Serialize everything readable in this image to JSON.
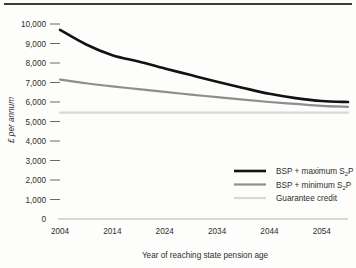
{
  "chart_data": {
    "type": "line",
    "title": "",
    "xlabel": "Year of reaching state pension age",
    "ylabel": "£ per annum",
    "x": [
      2004,
      2009,
      2014,
      2019,
      2024,
      2029,
      2034,
      2039,
      2044,
      2049,
      2054,
      2059
    ],
    "xlim": [
      2004,
      2059
    ],
    "ylim": [
      0,
      10000
    ],
    "xticks": [
      "2004",
      "2014",
      "2024",
      "2034",
      "2044",
      "2054"
    ],
    "xtick_values": [
      2004,
      2014,
      2024,
      2034,
      2044,
      2054
    ],
    "yticks": [
      "0",
      "1,000",
      "2,000",
      "3,000",
      "4,000",
      "5,000",
      "6,000",
      "7,000",
      "8,000",
      "9,000",
      "10,000"
    ],
    "ytick_values": [
      0,
      1000,
      2000,
      3000,
      4000,
      5000,
      6000,
      7000,
      8000,
      9000,
      10000
    ],
    "grid": false,
    "legend_position": "center-right",
    "series": [
      {
        "name": "BSP + maximum S2P",
        "name_base": "BSP + maximum S",
        "name_sub": "2",
        "name_tail": "P",
        "color": "#121212",
        "width": 2.6,
        "values": [
          9700,
          8950,
          8400,
          8080,
          7720,
          7380,
          7040,
          6720,
          6420,
          6200,
          6050,
          6000
        ]
      },
      {
        "name": "BSP + minimum S2P",
        "name_base": "BSP + minimum S",
        "name_sub": "2",
        "name_tail": "P",
        "color": "#8e8e8e",
        "width": 2.2,
        "values": [
          7150,
          6960,
          6800,
          6660,
          6520,
          6380,
          6250,
          6120,
          6000,
          5900,
          5800,
          5750
        ]
      },
      {
        "name": "Guarantee credit",
        "name_base": "Guarantee credit",
        "name_sub": "",
        "name_tail": "",
        "color": "#d8d8d8",
        "width": 2.2,
        "values": [
          5450,
          5450,
          5450,
          5450,
          5450,
          5450,
          5450,
          5450,
          5450,
          5450,
          5450,
          5450
        ]
      }
    ]
  },
  "colors": {
    "maximum_s2p": "#121212",
    "minimum_s2p": "#8e8e8e",
    "guarantee_credit": "#d8d8d8",
    "background": "#fdfdfb",
    "text": "#2e2e2e"
  }
}
